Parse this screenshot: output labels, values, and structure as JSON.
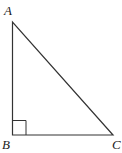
{
  "diagram": {
    "type": "right-triangle",
    "vertices": {
      "A": {
        "label": "A",
        "x": 13,
        "y": 22
      },
      "B": {
        "label": "B",
        "x": 12,
        "y": 135
      },
      "C": {
        "label": "C",
        "x": 113,
        "y": 135
      }
    },
    "right_angle_at": "B",
    "stroke_color": "#333333"
  }
}
